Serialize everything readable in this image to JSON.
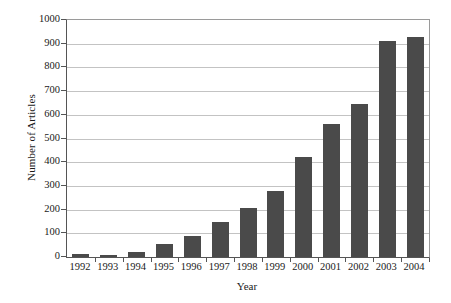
{
  "chart_data": {
    "type": "bar",
    "title": "",
    "xlabel": "Year",
    "ylabel": "Number of Articles",
    "categories": [
      "1992",
      "1993",
      "1994",
      "1995",
      "1996",
      "1997",
      "1998",
      "1999",
      "2000",
      "2001",
      "2002",
      "2003",
      "2004"
    ],
    "values": [
      12,
      8,
      20,
      55,
      90,
      148,
      205,
      280,
      420,
      563,
      645,
      912,
      928
    ],
    "series": [
      {
        "name": "Number of Articles",
        "values": [
          12,
          8,
          20,
          55,
          90,
          148,
          205,
          280,
          420,
          563,
          645,
          912,
          928
        ]
      }
    ],
    "ylim": [
      0,
      1000
    ],
    "y_ticks": [
      0,
      100,
      200,
      300,
      400,
      500,
      600,
      700,
      800,
      900,
      1000
    ],
    "y_tick_labels": [
      "0",
      "100",
      "200",
      "300",
      "400",
      "500",
      "600",
      "700",
      "800",
      "900",
      "1000"
    ],
    "grid": true,
    "grid_axis": "y",
    "legend": false,
    "legend_position": "none",
    "bar_color": "#4a4a4a",
    "gridline_color": "#c3c3c3",
    "axis_color": "#555555",
    "background_color": "#ffffff"
  }
}
